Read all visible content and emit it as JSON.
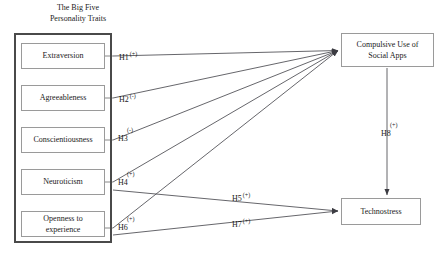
{
  "diagram": {
    "title_lines": [
      "The Big Five",
      "Personality Traits"
    ],
    "traits": [
      {
        "id": "extraversion",
        "label": "Extraversion",
        "label_line2": ""
      },
      {
        "id": "agreeableness",
        "label": "Agreeableness",
        "label_line2": ""
      },
      {
        "id": "conscientiousness",
        "label": "Conscientiousness",
        "label_line2": ""
      },
      {
        "id": "neuroticism",
        "label": "Neuroticism",
        "label_line2": ""
      },
      {
        "id": "openness",
        "label": "Openness to",
        "label_line2": "experience"
      }
    ],
    "outcomes": {
      "compulsive_use_line1": "Compulsive Use of",
      "compulsive_use_line2": "Social Apps",
      "technostress": "Technostress"
    },
    "hypotheses": [
      {
        "id": "H1",
        "label": "H1",
        "sign": "(+)",
        "from": "Extraversion",
        "to": "Compulsive Use of Social Apps"
      },
      {
        "id": "H2",
        "label": "H2",
        "sign": "(-)",
        "from": "Agreeableness",
        "to": "Compulsive Use of Social Apps"
      },
      {
        "id": "H3",
        "label": "H3",
        "sign": "(-)",
        "from": "Conscientiousness",
        "to": "Compulsive Use of Social Apps"
      },
      {
        "id": "H4",
        "label": "H4",
        "sign": "(+)",
        "from": "Neuroticism",
        "to": "Compulsive Use of Social Apps"
      },
      {
        "id": "H5",
        "label": "H5",
        "sign": "(+)",
        "from": "Neuroticism",
        "to": "Technostress"
      },
      {
        "id": "H6",
        "label": "H6",
        "sign": "(+)",
        "from": "Openness to experience",
        "to": "Compulsive Use of Social Apps"
      },
      {
        "id": "H7",
        "label": "H7",
        "sign": "(+)",
        "from": "Openness to experience",
        "to": "Technostress"
      },
      {
        "id": "H8",
        "label": "H8",
        "sign": "(+)",
        "from": "Compulsive Use of Social Apps",
        "to": "Technostress"
      }
    ],
    "colors": {
      "container_border": "#4a4a4a",
      "box_border": "#9a9a9a",
      "line": "#55555a",
      "text": "#1a1a1a",
      "background": "#ffffff"
    }
  }
}
